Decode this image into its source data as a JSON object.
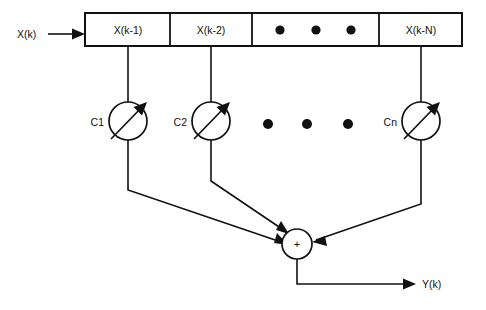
{
  "figure": {
    "background_color": "#ffffff",
    "line_color": "#111111"
  },
  "input": {
    "label": "X(k)",
    "arrow_name": "input-arrow"
  },
  "output": {
    "label": "Y(k)",
    "arrow_name": "output-arrow"
  },
  "delay_line": {
    "name": "tapped-delay-line",
    "taps": [
      {
        "label": "X(k-1)",
        "cx": 128
      },
      {
        "label": "X(k-2)",
        "cx": 211
      },
      {
        "label": "",
        "cx": 316,
        "ellipsis": true
      },
      {
        "label": "X(k-N)",
        "cx": 421
      }
    ]
  },
  "ellipsis_in_box": {
    "name": "box-ellipsis-dots",
    "count": 3,
    "dots_x": [
      280,
      316,
      351
    ],
    "dots_y": 30,
    "radius": 4.6
  },
  "ellipsis_between_gains": {
    "name": "gain-row-ellipsis-dots",
    "count": 3,
    "dots_x": [
      268,
      307,
      348
    ],
    "dots_y": 124,
    "radius": 5.0
  },
  "gains": [
    {
      "label": "C1",
      "cx": 128,
      "cy": 121,
      "r": 19
    },
    {
      "label": "C2",
      "cx": 211,
      "cy": 121,
      "r": 19
    },
    {
      "label": "Cn",
      "cx": 421,
      "cy": 121,
      "r": 19
    }
  ],
  "summer": {
    "label": "+",
    "name": "summing-junction",
    "cx": 297,
    "cy": 244,
    "r": 15
  }
}
